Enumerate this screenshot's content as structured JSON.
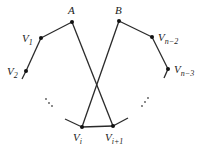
{
  "diagram": {
    "type": "polygon-with-crossing-edges",
    "vertices": [
      {
        "id": "A",
        "label": "A",
        "sub": "",
        "x": 72,
        "y": 22
      },
      {
        "id": "B",
        "label": "B",
        "sub": "",
        "x": 119,
        "y": 21
      },
      {
        "id": "V1",
        "label": "V",
        "sub": "1",
        "x": 41,
        "y": 38
      },
      {
        "id": "V2",
        "label": "V",
        "sub": "2",
        "x": 26,
        "y": 71
      },
      {
        "id": "Vn2",
        "label": "V",
        "sub": "n−2",
        "x": 152,
        "y": 37
      },
      {
        "id": "Vn3",
        "label": "V",
        "sub": "n−3",
        "x": 168,
        "y": 69
      },
      {
        "id": "Vi",
        "label": "V",
        "sub": "i",
        "x": 82,
        "y": 127
      },
      {
        "id": "Vi1",
        "label": "V",
        "sub": "i+1",
        "x": 113,
        "y": 126
      }
    ],
    "edges": [
      [
        "A",
        "V1"
      ],
      [
        "V1",
        "V2"
      ],
      [
        "B",
        "Vn2"
      ],
      [
        "Vn2",
        "Vn3"
      ],
      [
        "A",
        "Vi1"
      ],
      [
        "B",
        "Vi"
      ],
      [
        "Vi",
        "Vi1"
      ]
    ],
    "ellipses": [
      "left-dots",
      "right-dots"
    ],
    "labels": {
      "A": "A",
      "B": "B",
      "V1": {
        "main": "V",
        "sub": "1"
      },
      "V2": {
        "main": "V",
        "sub": "2"
      },
      "Vn2": {
        "main": "V",
        "sub": "n−2"
      },
      "Vn3": {
        "main": "V",
        "sub": "n−3"
      },
      "Vi": {
        "main": "V",
        "sub": "i"
      },
      "Vi1": {
        "main": "V",
        "sub": "i+1"
      }
    },
    "ellipsis_glyph": "⋱"
  }
}
